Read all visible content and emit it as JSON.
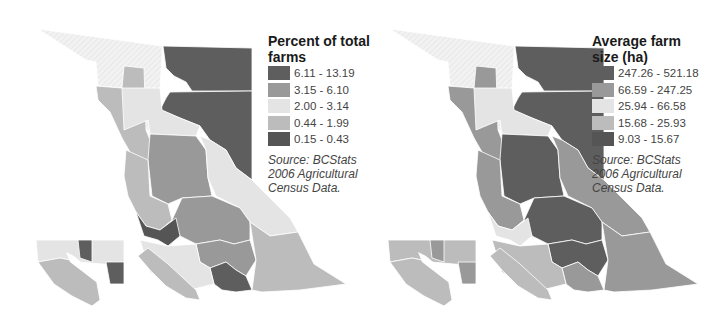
{
  "maps": [
    {
      "id": "percent",
      "legend": {
        "title": "Percent of total farms",
        "classes": [
          {
            "label": "6.11 - 13.19",
            "color": "#5e5e5e"
          },
          {
            "label": "3.15 - 6.10",
            "color": "#999999"
          },
          {
            "label": "2.00 - 3.14",
            "color": "#e4e4e4"
          },
          {
            "label": "0.44 - 1.99",
            "color": "#bcbcbc"
          },
          {
            "label": "0.15 - 0.43",
            "color": "#555555"
          }
        ]
      },
      "source": "Source: BCStats 2006 Agricultural Census Data.",
      "region_classes": {
        "far_northwest": "none",
        "northeast_top": 0,
        "northeast_peace": 0,
        "stikine_corridor": 3,
        "north_central_light": 2,
        "central_interior": 1,
        "cariboo": 1,
        "rockies_east": 2,
        "coast_mountains": 3,
        "central_coast": 4,
        "thompson": 1,
        "okanagan": 0,
        "kootenay_east": 3,
        "south_coast": 2,
        "vancouver_island": 3
      }
    },
    {
      "id": "avgsize",
      "legend": {
        "title": "Average farm size (ha)",
        "classes": [
          {
            "label": "247.26 - 521.18",
            "color": "#5e5e5e"
          },
          {
            "label": "66.59 - 247.25",
            "color": "#999999"
          },
          {
            "label": "25.94 - 66.58",
            "color": "#e4e4e4"
          },
          {
            "label": "15.68 - 25.93",
            "color": "#bcbcbc"
          },
          {
            "label": "9.03 - 15.67",
            "color": "#555555"
          }
        ]
      },
      "source": "Source: BCStats 2006 Agricultural Census Data.",
      "region_classes": {
        "far_northwest": "none",
        "northeast_top": 0,
        "northeast_peace": 0,
        "stikine_corridor": 1,
        "north_central_light": 2,
        "central_interior": 0,
        "cariboo": 0,
        "rockies_east": 1,
        "coast_mountains": 1,
        "central_coast": 2,
        "thompson": 0,
        "okanagan": 1,
        "kootenay_east": 1,
        "south_coast": 3,
        "vancouver_island": 3
      }
    }
  ]
}
